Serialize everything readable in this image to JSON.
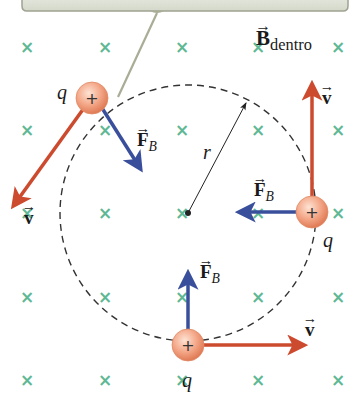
{
  "diagram": {
    "colors": {
      "background": "#ffffff",
      "top_bar": "#dfe3d8",
      "top_bar_edge": "#9ea391",
      "rod": "#a9ad95",
      "x_mark": "#5fb894",
      "velocity_arrow": "#cc4a2e",
      "force_arrow": "#3a4f9c",
      "charge_fill": "#f4a98a",
      "charge_edge": "#e08a66",
      "path": "#333333",
      "radius_line": "#222222"
    },
    "field": {
      "label_symbol": "B",
      "label_subscript": "dentro",
      "marker": "×",
      "grid_x": [
        27,
        105,
        182,
        258,
        338
      ],
      "grid_y": [
        47,
        130,
        213,
        297,
        380
      ]
    },
    "circle": {
      "cx": 188,
      "cy": 213,
      "r": 128,
      "style": "dashed"
    },
    "radius": {
      "label": "r"
    },
    "charges": [
      {
        "id": "top-left",
        "sign": "+",
        "label": "q",
        "x": 92,
        "y": 98,
        "velocity": {
          "label": "v",
          "dx": -82,
          "dy": 112
        },
        "force": {
          "label": "F",
          "subscript": "B",
          "dx": 52,
          "dy": 76
        }
      },
      {
        "id": "right",
        "sign": "+",
        "label": "q",
        "x": 312,
        "y": 212,
        "velocity": {
          "label": "v",
          "dx": 0,
          "dy": -130
        },
        "force": {
          "label": "F",
          "subscript": "B",
          "dx": -78,
          "dy": 0
        }
      },
      {
        "id": "bottom",
        "sign": "+",
        "label": "q",
        "x": 188,
        "y": 345,
        "velocity": {
          "label": "v",
          "dx": 120,
          "dy": 0
        },
        "force": {
          "label": "F",
          "subscript": "B",
          "dx": 0,
          "dy": -78
        }
      }
    ]
  }
}
